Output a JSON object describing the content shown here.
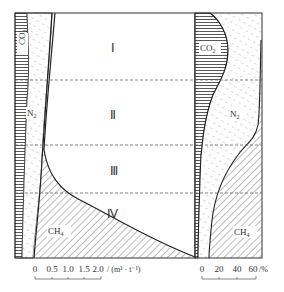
{
  "diagram": {
    "zones": [
      {
        "id": "I",
        "label": "Ⅰ"
      },
      {
        "id": "II",
        "label": "Ⅱ"
      },
      {
        "id": "III",
        "label": "Ⅲ"
      },
      {
        "id": "IV",
        "label": "Ⅳ"
      }
    ],
    "left_panel": {
      "gas_labels": {
        "co2": "CO",
        "co2_sub": "2",
        "n2": "N",
        "n2_sub": "2",
        "ch4": "CH",
        "ch4_sub": "4"
      },
      "axis": {
        "ticks": [
          "0",
          "0.5",
          "1.0",
          "1.5",
          "2.0"
        ],
        "unit": "/ (m³ · t⁻¹)"
      }
    },
    "right_panel": {
      "gas_labels": {
        "co2": "CO",
        "co2_sub": "2",
        "n2": "N",
        "n2_sub": "2",
        "ch4": "CH",
        "ch4_sub": "4"
      },
      "axis": {
        "ticks": [
          "0",
          "20",
          "40",
          "60"
        ],
        "unit": "/%"
      }
    },
    "colors": {
      "line": "#333333",
      "hatch": "#555555",
      "dash": "#666666"
    }
  }
}
